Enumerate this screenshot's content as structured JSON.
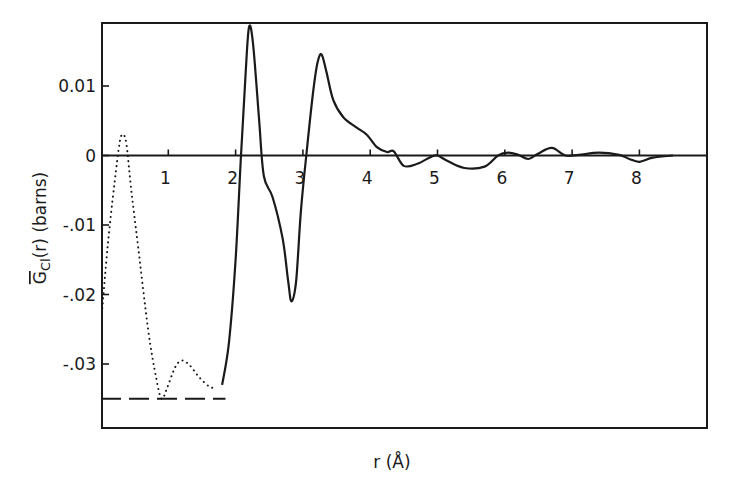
{
  "chart_data": {
    "type": "line",
    "title": "",
    "xlabel": "r (Å)",
    "ylabel": "G̅Cl(r) (barns)",
    "ylabel_parts": {
      "symbol": "G",
      "subscript": "Cl",
      "rest": "(r) (barns)"
    },
    "xlim": [
      0,
      9.0
    ],
    "ylim": [
      -0.04,
      0.0185
    ],
    "grid": false,
    "legend": null,
    "x_ticks": [
      1,
      2,
      3,
      4,
      5,
      6,
      7,
      8
    ],
    "x_tick_labels": [
      "1",
      "2",
      "3",
      "4",
      "5",
      "6",
      "7",
      "8"
    ],
    "y_ticks": [
      0.01,
      0,
      -0.01,
      -0.02,
      -0.03
    ],
    "y_tick_labels": [
      "0.01",
      "0",
      "-.01",
      "-.02",
      "-.03"
    ],
    "series": [
      {
        "name": "G_Cl(r) measured",
        "style": "solid",
        "x": [
          1.8,
          1.9,
          2.0,
          2.08,
          2.15,
          2.2,
          2.26,
          2.35,
          2.42,
          2.55,
          2.7,
          2.78,
          2.83,
          2.9,
          2.97,
          3.05,
          3.15,
          3.22,
          3.28,
          3.35,
          3.45,
          3.6,
          3.8,
          3.95,
          4.1,
          4.25,
          4.35,
          4.5,
          4.7,
          4.9,
          5.0,
          5.15,
          5.4,
          5.7,
          5.9,
          6.05,
          6.2,
          6.35,
          6.5,
          6.7,
          6.9,
          7.1,
          7.4,
          7.7,
          7.85,
          8.0,
          8.2,
          8.5
        ],
        "y": [
          -0.033,
          -0.027,
          -0.015,
          0.0,
          0.012,
          0.0185,
          0.016,
          0.005,
          -0.003,
          -0.006,
          -0.012,
          -0.018,
          -0.021,
          -0.018,
          -0.008,
          0.0,
          0.009,
          0.0135,
          0.0145,
          0.012,
          0.008,
          0.0055,
          0.004,
          0.003,
          0.0012,
          0.0005,
          0.0006,
          -0.0015,
          -0.0012,
          -0.0002,
          0.0,
          -0.0008,
          -0.0018,
          -0.0016,
          0.0,
          0.0004,
          0.0001,
          -0.0005,
          0.0003,
          0.0011,
          0.0,
          0.0001,
          0.0004,
          0.0001,
          -0.0005,
          -0.0009,
          -0.0003,
          0.0
        ]
      },
      {
        "name": "extrapolated (low r)",
        "style": "dotted",
        "x": [
          0.02,
          0.1,
          0.2,
          0.28,
          0.33,
          0.38,
          0.45,
          0.55,
          0.7,
          0.82,
          0.9,
          0.98,
          1.1,
          1.2,
          1.32,
          1.45,
          1.6,
          1.7
        ],
        "y": [
          -0.022,
          -0.013,
          -0.004,
          0.002,
          0.003,
          0.0015,
          -0.005,
          -0.013,
          -0.025,
          -0.032,
          -0.035,
          -0.0335,
          -0.0305,
          -0.0295,
          -0.0302,
          -0.0318,
          -0.0332,
          -0.0335
        ]
      },
      {
        "name": "low-r limit",
        "style": "dashed",
        "x": [
          0.0,
          1.85
        ],
        "y": [
          -0.035,
          -0.035
        ]
      }
    ]
  },
  "axes": {
    "x_title": "r (Å)",
    "y_title_symbol": "G",
    "y_title_sub": "Cl",
    "y_title_rest": "(r) (barns)"
  }
}
